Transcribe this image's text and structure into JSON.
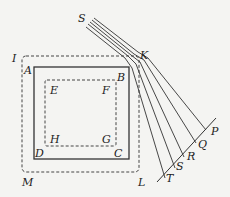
{
  "labels": {
    "S_top": "S",
    "K": "K",
    "I": "I",
    "A": "A",
    "B": "B",
    "E": "E",
    "F": "F",
    "H": "H",
    "G": "G",
    "D": "D",
    "C": "C",
    "M": "M",
    "L": "L",
    "T": "T",
    "S_bottom": "S",
    "R": "R",
    "Q": "Q",
    "P": "P"
  },
  "colors": {
    "line": "#333333",
    "background": "#f4f4f2"
  }
}
